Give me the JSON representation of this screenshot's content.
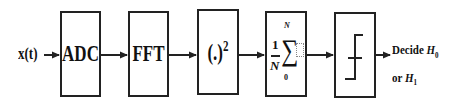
{
  "diagram": {
    "input_label": "x(t)",
    "blocks": [
      {
        "id": "adc",
        "label": "ADC"
      },
      {
        "id": "fft",
        "label": "FFT"
      },
      {
        "id": "square",
        "label": "(.)",
        "superscript": "2"
      },
      {
        "id": "sum",
        "fraction_num": "1",
        "fraction_den": "N",
        "sum_upper": "N",
        "sum_lower": "0",
        "symbol": "∑"
      },
      {
        "id": "threshold",
        "icon": "threshold-step-icon"
      }
    ],
    "output_label": {
      "line1_prefix": "Decide ",
      "line1_var": "H",
      "line1_sub": "0",
      "line2_prefix": "or ",
      "line2_var": "H",
      "line2_sub": "1"
    },
    "colors": {
      "stroke": "#222222",
      "background": "#ffffff"
    }
  }
}
